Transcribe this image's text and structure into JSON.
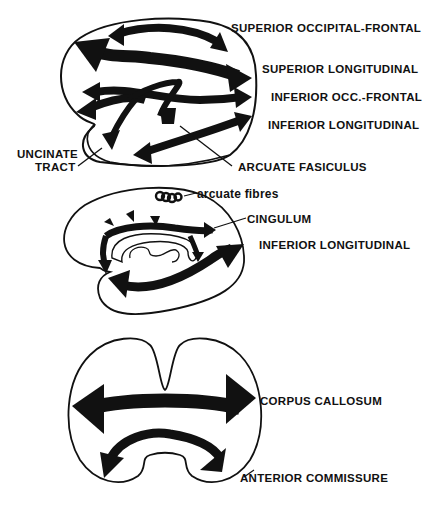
{
  "figure": {
    "panels": [
      {
        "id": "lateral",
        "description": "Lateral view of hemisphere with association tracts",
        "labels": {
          "superior_occipital_frontal": "SUPERIOR OCCIPITAL-FRONTAL",
          "superior_longitudinal": "SUPERIOR LONGITUDINAL",
          "inferior_occ_frontal": "INFERIOR OCC.-FRONTAL",
          "inferior_longitudinal": "INFERIOR LONGITUDINAL",
          "uncinate_line1": "UNCINATE",
          "uncinate_line2": "TRACT",
          "arcuate_fasiculus": "ARCUATE FASICULUS"
        }
      },
      {
        "id": "medial",
        "description": "Medial view of hemisphere",
        "labels": {
          "arcuate_fibres": "arcuate fibres",
          "cingulum": "CINGULUM",
          "inferior_longitudinal": "INFERIOR LONGITUDINAL"
        }
      },
      {
        "id": "coronal",
        "description": "Coronal section showing commissural tracts",
        "labels": {
          "corpus_callosum": "CORPUS CALLOSUM",
          "anterior_commissure": "ANTERIOR COMMISSURE"
        }
      }
    ],
    "colors": {
      "ink": "#111111",
      "background": "#ffffff"
    }
  }
}
